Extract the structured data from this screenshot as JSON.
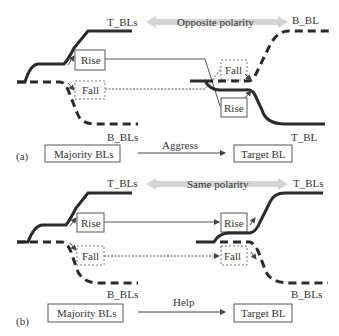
{
  "colors": {
    "line": "#2a2a2a",
    "thin": "#555555",
    "polarity_arrow": "#d4d4d4",
    "box_border": "#555555"
  },
  "panel_a": {
    "tag": "(a)",
    "top_left_label": "T_BLs",
    "bottom_left_label": "B_BLs",
    "top_right_label": "B_BL",
    "bottom_right_label": "T_BL",
    "polarity_label": "Opposite polarity",
    "left_rise": "Rise",
    "left_fall": "Fall",
    "right_fall": "Fall",
    "right_rise": "Rise",
    "majority_box": "Majority BLs",
    "relation_label": "Aggress",
    "target_box": "Target BL"
  },
  "panel_b": {
    "tag": "(b)",
    "top_left_label": "T_BLs",
    "bottom_left_label": "B_BLs",
    "top_right_label": "T_BLs",
    "bottom_right_label": "B_BLs",
    "polarity_label": "Same polarity",
    "left_rise": "Rise",
    "left_fall": "Fall",
    "right_rise": "Rise",
    "right_fall": "Fall",
    "majority_box": "Majority BLs",
    "relation_label": "Help",
    "target_box": "Target BL"
  }
}
